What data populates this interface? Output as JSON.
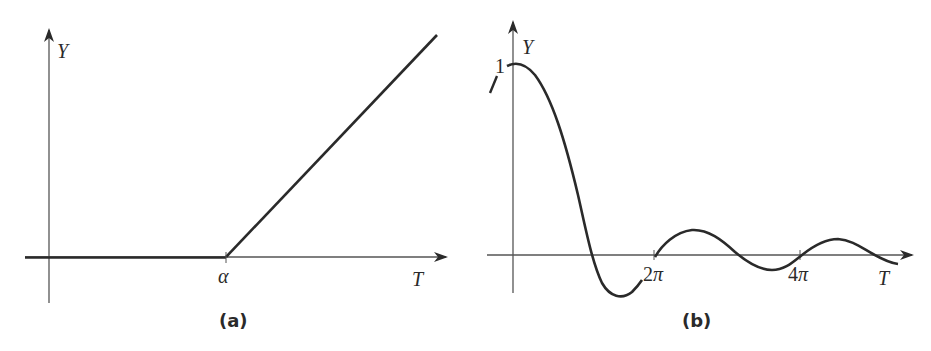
{
  "figure": {
    "panels": [
      {
        "id": "a",
        "caption": "(a)",
        "y_axis_label": "Y",
        "x_axis_label": "T",
        "tick_labels": [
          "α"
        ],
        "description": "Ramp function: Y = 0 for T < α, then increases linearly for T > α"
      },
      {
        "id": "b",
        "caption": "(b)",
        "y_axis_label": "Y",
        "x_axis_label": "T",
        "y_tick_label": "1",
        "tick_labels": [
          "2π",
          "4π"
        ],
        "description": "Damped oscillation starting at Y = 1 at T = 0, decaying toward zero"
      }
    ],
    "colors": {
      "ink": "#2a2a2a",
      "axis": "#555555",
      "background": "#ffffff"
    }
  }
}
